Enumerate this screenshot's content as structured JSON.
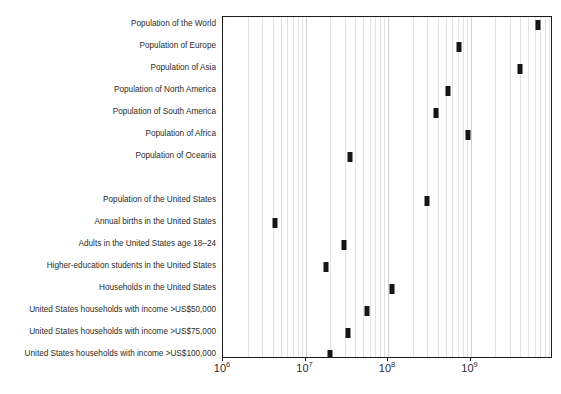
{
  "chart_data": {
    "type": "scatter",
    "title": "",
    "xlabel": "",
    "ylabel": "",
    "xscale": "log",
    "xlim": [
      1000000,
      10000000000
    ],
    "grid": true,
    "legend_position": "none",
    "x_tick_labels": [
      "10⁶",
      "10⁷",
      "10⁸",
      "10⁹"
    ],
    "x_tick_mantissas": [
      "10",
      "10",
      "10",
      "10"
    ],
    "x_tick_exponents": [
      "6",
      "7",
      "8",
      "9"
    ],
    "x_tick_values": [
      1000000,
      10000000,
      100000000,
      1000000000
    ],
    "categories": [
      "Population of the World",
      "Population of Europe",
      "Population of Asia",
      "Population of North America",
      "Population of South America",
      "Population of Africa",
      "Population of Oceania",
      "",
      "Population of the United States",
      "Annual births in the United States",
      "Adults in the United States age 18–24",
      "Higher-education students in the United States",
      "Households in the United States",
      "United States households with income >US$50,000",
      "United States households with income >US$75,000",
      "United States households with income >US$100,000"
    ],
    "points": [
      {
        "label": "Population of the World",
        "value": 6500000000,
        "row": 0,
        "spacer": false
      },
      {
        "label": "Population of Europe",
        "value": 730000000,
        "row": 1,
        "spacer": false
      },
      {
        "label": "Population of Asia",
        "value": 4000000000,
        "row": 2,
        "spacer": false
      },
      {
        "label": "Population of North America",
        "value": 530000000,
        "row": 3,
        "spacer": false
      },
      {
        "label": "Population of South America",
        "value": 385000000,
        "row": 4,
        "spacer": false
      },
      {
        "label": "Population of Africa",
        "value": 920000000,
        "row": 5,
        "spacer": false
      },
      {
        "label": "Population of Oceania",
        "value": 35000000,
        "row": 6,
        "spacer": false
      },
      {
        "label": "",
        "value": null,
        "row": 7,
        "spacer": true
      },
      {
        "label": "Population of the United States",
        "value": 300000000,
        "row": 8,
        "spacer": false
      },
      {
        "label": "Annual births in the United States",
        "value": 4300000,
        "row": 9,
        "spacer": false
      },
      {
        "label": "Adults in the United States age 18–24",
        "value": 29000000,
        "row": 10,
        "spacer": false
      },
      {
        "label": "Higher-education students in the United States",
        "value": 17500000,
        "row": 11,
        "spacer": false
      },
      {
        "label": "Households in the United States",
        "value": 113000000,
        "row": 12,
        "spacer": false
      },
      {
        "label": "United States households with income >US$50,000",
        "value": 55000000,
        "row": 13,
        "spacer": false
      },
      {
        "label": "United States households with income >US$75,000",
        "value": 33000000,
        "row": 14,
        "spacer": false
      },
      {
        "label": "United States households with income >US$100,000",
        "value": 20000000,
        "row": 15,
        "spacer": false
      }
    ],
    "colors": {
      "marker": "#161616",
      "frame": "#1a1a1a",
      "gridline": "#e2e2e2",
      "gridline_major": "#d2d2d2",
      "text": "#2b2b2b",
      "background": "#ffffff"
    }
  }
}
